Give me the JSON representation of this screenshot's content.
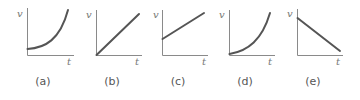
{
  "figure": {
    "panels": [
      {
        "id": "a",
        "label": "(a)",
        "y_axis_label": "v",
        "x_axis_label": "t",
        "shape": "exponential-increase-from-positive-intercept"
      },
      {
        "id": "b",
        "label": "(b)",
        "y_axis_label": "v",
        "x_axis_label": "t",
        "shape": "linear-increase-from-origin"
      },
      {
        "id": "c",
        "label": "(c)",
        "y_axis_label": "v",
        "x_axis_label": "t",
        "shape": "linear-increase-from-positive-intercept"
      },
      {
        "id": "d",
        "label": "(d)",
        "y_axis_label": "v",
        "x_axis_label": "t",
        "shape": "quadratic-increase-from-origin"
      },
      {
        "id": "e",
        "label": "(e)",
        "y_axis_label": "v",
        "x_axis_label": "t",
        "shape": "linear-decrease-from-positive-intercept"
      }
    ]
  },
  "colors": {
    "axis": "#8a8a8a",
    "curve": "#555555",
    "text": "#555555",
    "background": "#ffffff"
  }
}
